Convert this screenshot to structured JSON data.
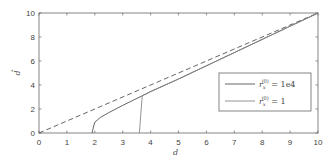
{
  "chart_data": {
    "type": "line",
    "title": "",
    "xlabel": "d",
    "ylabel": "d̂",
    "xlim": [
      0,
      10
    ],
    "ylim": [
      0,
      10
    ],
    "xticks": [
      0,
      1,
      2,
      3,
      4,
      5,
      6,
      7,
      8,
      9,
      10
    ],
    "yticks": [
      0,
      2,
      4,
      6,
      8,
      10
    ],
    "grid": false,
    "legend_position": "center-right",
    "series": [
      {
        "name": "reference (d̂ = d)",
        "style": "dashed",
        "color": "#555555",
        "x": [
          0,
          10
        ],
        "y": [
          0,
          10
        ]
      },
      {
        "name": "r_x^(0) = 1e4",
        "style": "solid",
        "color": "#555555",
        "x": [
          1.9,
          1.95,
          2.0,
          2.2,
          2.5,
          3.0,
          3.7,
          4.0,
          5.0,
          6.0,
          7.0,
          8.0,
          9.0,
          10.0
        ],
        "y": [
          0.0,
          0.5,
          0.9,
          1.3,
          1.7,
          2.3,
          3.1,
          3.45,
          4.5,
          5.6,
          6.7,
          7.8,
          8.9,
          10.0
        ]
      },
      {
        "name": "r_x^(0) = 1",
        "style": "solid",
        "color": "#888888",
        "x": [
          3.6,
          3.7,
          4.0,
          5.0,
          6.0,
          7.0,
          8.0,
          9.0,
          10.0
        ],
        "y": [
          0.0,
          3.1,
          3.45,
          4.5,
          5.6,
          6.7,
          7.8,
          8.9,
          10.0
        ]
      }
    ],
    "legend": [
      {
        "label_main": "r",
        "label_sub": "x",
        "label_sup": "(0)",
        "label_value": " = 1e4"
      },
      {
        "label_main": "r",
        "label_sub": "x",
        "label_sup": "(0)",
        "label_value": " = 1"
      }
    ]
  }
}
